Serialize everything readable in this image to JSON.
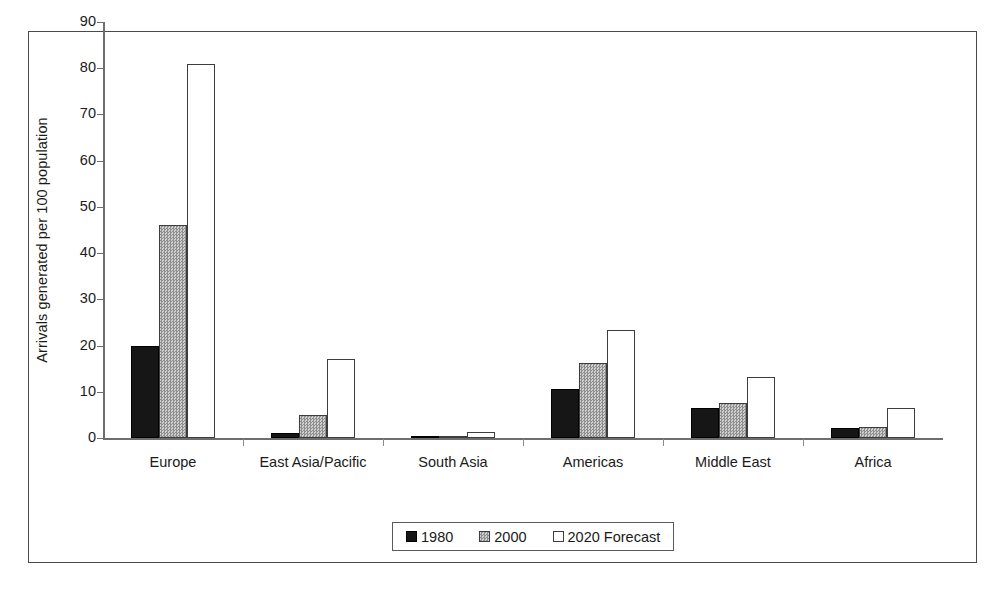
{
  "chart_data": {
    "type": "bar",
    "title": "",
    "xlabel": "",
    "ylabel": "Arrivals generated per 100 population",
    "ylim": [
      0,
      90
    ],
    "yticks": [
      0,
      10,
      20,
      30,
      40,
      50,
      60,
      70,
      80,
      90
    ],
    "grid": false,
    "legend_position": "bottom-center",
    "categories": [
      "Europe",
      "East Asia/Pacific",
      "South Asia",
      "Americas",
      "Middle East",
      "Africa"
    ],
    "series": [
      {
        "name": "1980",
        "color": "#161616",
        "values": [
          20,
          1,
          0.2,
          10.5,
          6.5,
          2.2
        ]
      },
      {
        "name": "2000",
        "color": "#b0b0b0",
        "values": [
          46,
          5,
          0.5,
          16.3,
          7.5,
          2.3
        ]
      },
      {
        "name": "2020 Forecast",
        "color": "#ffffff",
        "values": [
          81,
          17,
          1.3,
          23.3,
          13.3,
          6.5
        ]
      }
    ]
  },
  "axis": {
    "y_title": "Arrivals generated per 100 population"
  },
  "legend": {
    "entries": [
      {
        "label": "1980"
      },
      {
        "label": "2000"
      },
      {
        "label": "2020 Forecast"
      }
    ]
  }
}
